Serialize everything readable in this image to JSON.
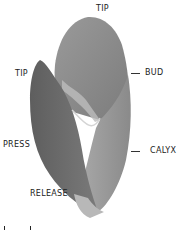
{
  "diagram": {
    "labels": {
      "tip_top": "TIP",
      "tip_left": "TIP",
      "bud": "BUD",
      "press": "PRESS",
      "calyx": "CALYX",
      "release": "RELEASE"
    },
    "colors": {
      "bud_fill": "#8f8f8f",
      "left_leaf_fill": "#6f6f6f",
      "calyx_fill": "#9a9a9a",
      "highlight": "#c8c8c8",
      "text": "#222222"
    }
  }
}
